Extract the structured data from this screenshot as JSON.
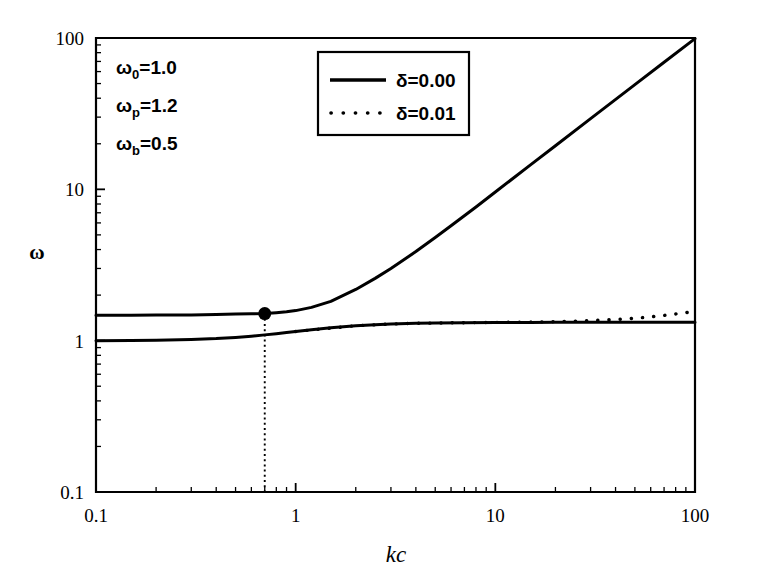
{
  "chart_data": {
    "type": "line",
    "title": "",
    "xlabel": "kc",
    "ylabel": "ω",
    "xscale": "log",
    "yscale": "log",
    "xlim": [
      0.1,
      100
    ],
    "ylim": [
      0.1,
      100
    ],
    "xticks": [
      "0.1",
      "1",
      "10",
      "100"
    ],
    "xtick_values": [
      0.1,
      1,
      10,
      100
    ],
    "yticks": [
      "0.1",
      "1",
      "10",
      "100"
    ],
    "ytick_values": [
      0.1,
      1,
      10,
      100
    ],
    "grid": false,
    "legend_position": "top-center",
    "legend": [
      {
        "label": "δ=0.00",
        "style": "solid"
      },
      {
        "label": "δ=0.01",
        "style": "dotted"
      }
    ],
    "annotations": [
      {
        "symbol": "ω",
        "subscript": "0",
        "equals": "=1.0",
        "text": "ω₀=1.0"
      },
      {
        "symbol": "ω",
        "subscript": "p",
        "equals": "=1.2",
        "text": "ωₚ=1.2"
      },
      {
        "symbol": "ω",
        "subscript": "b",
        "equals": "=0.5",
        "text": "ωᵇ=0.5"
      }
    ],
    "marker_points": [
      {
        "label": "crossing-point",
        "x": 0.7,
        "y": 1.51,
        "style": "filled-circle",
        "droplines": "vertical-dotted-to-x-axis"
      }
    ],
    "series": [
      {
        "name": "upper-branch",
        "delta": "0.00",
        "style": "solid",
        "x": [
          0.1,
          0.15,
          0.2,
          0.3,
          0.4,
          0.5,
          0.6,
          0.7,
          0.8,
          0.9,
          1.0,
          1.2,
          1.5,
          2.0,
          2.5,
          3.0,
          4.0,
          5.0,
          6.0,
          8.0,
          10.0,
          15.0,
          20.0,
          30.0,
          50.0,
          70.0,
          100.0
        ],
        "y": [
          1.47,
          1.47,
          1.475,
          1.48,
          1.49,
          1.5,
          1.505,
          1.51,
          1.53,
          1.55,
          1.58,
          1.66,
          1.82,
          2.18,
          2.58,
          3.0,
          3.88,
          4.8,
          5.75,
          7.65,
          9.6,
          14.5,
          19.4,
          29.3,
          49.2,
          69.2,
          99.0
        ]
      },
      {
        "name": "lower-branch",
        "delta": "0.00",
        "style": "solid",
        "x": [
          0.1,
          0.15,
          0.2,
          0.3,
          0.4,
          0.5,
          0.6,
          0.7,
          0.8,
          0.9,
          1.0,
          1.2,
          1.5,
          2.0,
          2.5,
          3.0,
          4.0,
          5.0,
          7.0,
          10.0,
          15.0,
          20.0,
          30.0,
          50.0,
          70.0,
          100.0
        ],
        "y": [
          1.0,
          1.003,
          1.008,
          1.018,
          1.032,
          1.05,
          1.07,
          1.092,
          1.112,
          1.132,
          1.15,
          1.182,
          1.218,
          1.255,
          1.275,
          1.288,
          1.302,
          1.308,
          1.315,
          1.318,
          1.32,
          1.321,
          1.322,
          1.322,
          1.322,
          1.322
        ]
      },
      {
        "name": "damped-branch",
        "delta": "0.01",
        "style": "dotted",
        "x": [
          1.0,
          2.0,
          3.0,
          4.0,
          5.0,
          7.0,
          10.0,
          14.0,
          18.0,
          22.0,
          28.0,
          35.0,
          45.0,
          58.0,
          72.0,
          88.0,
          100.0
        ],
        "y": [
          1.15,
          1.255,
          1.288,
          1.302,
          1.308,
          1.315,
          1.32,
          1.325,
          1.332,
          1.34,
          1.352,
          1.368,
          1.392,
          1.43,
          1.475,
          1.525,
          1.56
        ]
      }
    ]
  }
}
